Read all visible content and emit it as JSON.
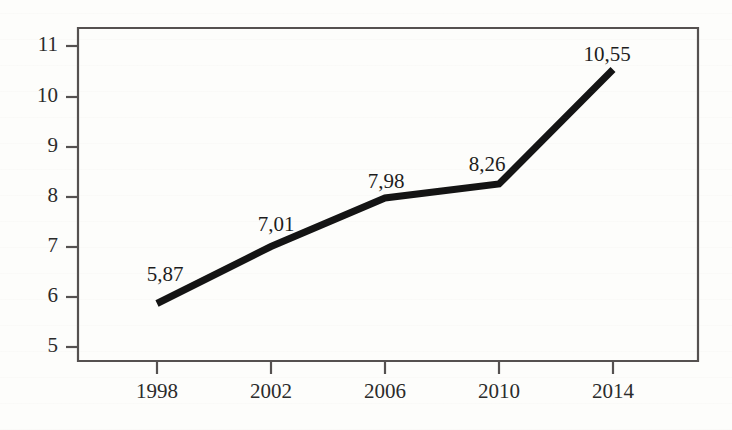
{
  "chart_data": {
    "type": "line",
    "title": "",
    "subtitle": "",
    "xlabel": "",
    "ylabel": "",
    "categories": [
      "1998",
      "2002",
      "2006",
      "2010",
      "2014"
    ],
    "x": [
      1998,
      2002,
      2006,
      2010,
      2014
    ],
    "values": [
      5.87,
      7.01,
      7.98,
      8.26,
      10.55
    ],
    "point_labels": [
      "5,87",
      "7,01",
      "7,98",
      "8,26",
      "10,55"
    ],
    "decimal_separator": ",",
    "series": [
      {
        "name": "",
        "values": [
          5.87,
          7.01,
          7.98,
          8.26,
          10.55
        ],
        "color": "#141414"
      }
    ],
    "ylim": [
      5,
      11
    ],
    "y_ticks": [
      5,
      6,
      7,
      8,
      9,
      10,
      11
    ],
    "y_tick_labels": [
      "5",
      "6",
      "7",
      "8",
      "9",
      "10",
      "11"
    ],
    "x_tick_labels": [
      "1998",
      "2002",
      "2006",
      "2010",
      "2014"
    ],
    "grid": false,
    "legend": false,
    "legend_position": "none",
    "line_color": "#141414",
    "axis_color": "#555150",
    "background_color": "#fdfdfb",
    "markers": false,
    "annotations": []
  },
  "axes": {
    "y_labels": [
      "11",
      "10",
      "9",
      "8",
      "7",
      "6",
      "5"
    ],
    "x_labels": [
      "1998",
      "2002",
      "2006",
      "2010",
      "2014"
    ]
  },
  "labels": {
    "p0": "5,87",
    "p1": "7,01",
    "p2": "7,98",
    "p3": "8,26",
    "p4": "10,55"
  }
}
